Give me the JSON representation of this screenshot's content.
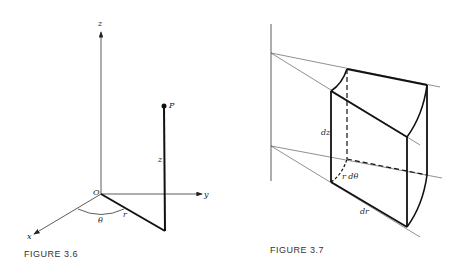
{
  "figures": [
    {
      "caption": "FIGURE 3.6",
      "labels": {
        "z_axis": "z",
        "y_axis": "y",
        "x_axis": "x",
        "origin": "O",
        "point": "P",
        "height": "z",
        "radius": "r",
        "angle": "θ"
      }
    },
    {
      "caption": "FIGURE 3.7",
      "labels": {
        "dz": "dz",
        "rdtheta": "r dθ",
        "dr": "dr"
      }
    }
  ]
}
